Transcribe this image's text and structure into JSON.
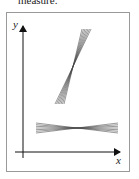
{
  "caption": "measure.",
  "diagram": {
    "axes": {
      "x_label": "x",
      "y_label": "y"
    },
    "fans": [
      {
        "name": "steep-line-bundle",
        "line_count": 7,
        "description": "nearly vertical bundle of lines crossing at one point"
      },
      {
        "name": "flat-line-bundle",
        "line_count": 7,
        "description": "nearly horizontal bundle of lines crossing at one point"
      }
    ],
    "colors": {
      "frame": "#9a9a9a",
      "lines": "#333333"
    }
  }
}
